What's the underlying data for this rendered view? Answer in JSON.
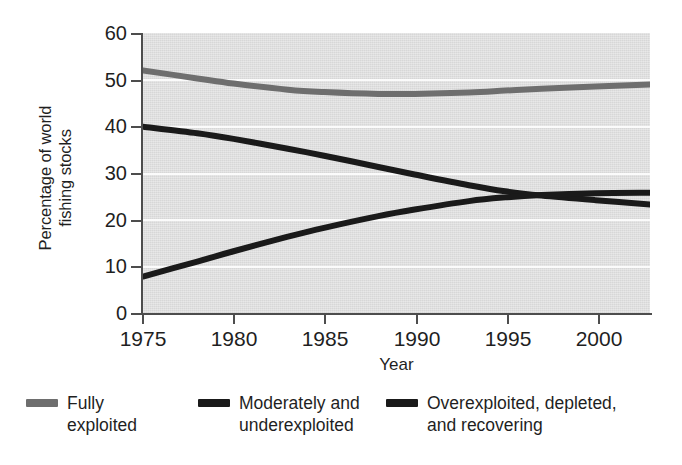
{
  "chart_data": {
    "type": "line",
    "title": "",
    "subtitle": "",
    "xlabel": "Year",
    "ylabel": "Percentage of world\nfishing stocks",
    "xlim": [
      1975,
      2003
    ],
    "ylim": [
      0,
      60
    ],
    "xticks": [
      1975,
      1980,
      1985,
      1990,
      1995,
      2000
    ],
    "yticks": [
      0,
      10,
      20,
      30,
      40,
      50,
      60
    ],
    "grid": "horizontal-white",
    "legend_position": "bottom",
    "plot_background": "#dedede",
    "x": [
      1975,
      1978,
      1980,
      1983,
      1985,
      1988,
      1990,
      1993,
      1995,
      1997,
      2000,
      2003
    ],
    "series": [
      {
        "name": "Fully\nexploited",
        "color": "#6e6e6e",
        "values": [
          52,
          50.3,
          49.2,
          47.9,
          47.4,
          47.0,
          47.0,
          47.3,
          47.7,
          48.1,
          48.6,
          49.0
        ]
      },
      {
        "name": "Moderately and\nunderexploited",
        "color": "#1a1a1a",
        "values": [
          40,
          38.6,
          37.4,
          35.3,
          33.8,
          31.4,
          29.8,
          27.5,
          26.2,
          25.3,
          24.3,
          23.4
        ]
      },
      {
        "name": "Overexploited, depleted,\nand recovering",
        "color": "#1a1a1a",
        "values": [
          8,
          11.2,
          13.4,
          16.5,
          18.4,
          20.9,
          22.3,
          24.1,
          24.9,
          25.4,
          25.8,
          25.9
        ]
      }
    ],
    "annotations": []
  },
  "axes": {
    "y_title": "Percentage of world\nfishing stocks",
    "x_title": "Year",
    "y_tick_labels": [
      "60",
      "50",
      "40",
      "30",
      "20",
      "10",
      "0"
    ],
    "x_tick_labels": [
      "1975",
      "1980",
      "1985",
      "1990",
      "1995",
      "2000"
    ]
  },
  "legend": {
    "items": [
      {
        "label": "Fully\nexploited",
        "color": "#6e6e6e"
      },
      {
        "label": "Moderately and\nunderexploited",
        "color": "#1a1a1a"
      },
      {
        "label": "Overexploited, depleted,\nand recovering",
        "color": "#1a1a1a"
      }
    ]
  }
}
